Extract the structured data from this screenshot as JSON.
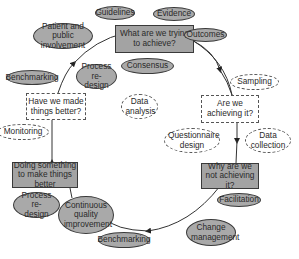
{
  "diagram": {
    "type": "cycle",
    "stages": [
      {
        "id": "s1",
        "label": "What are we trying to achieve?"
      },
      {
        "id": "s2",
        "label": "Are we achieving it?"
      },
      {
        "id": "s3",
        "label": "Why are we not achieving it?"
      },
      {
        "id": "s4",
        "label": "Doing something to make things better"
      },
      {
        "id": "s5",
        "label": "Have we made things better?"
      }
    ],
    "tools_solid": {
      "guidelines": "Guidelines",
      "evidence": "Evidence",
      "outcomes": "Outcomes",
      "patient": "Patient and public involvement",
      "consensus": "Consensus",
      "process_top": "Process re-design",
      "benchmarking_left": "Benchmarking",
      "facilitation": "Facilitation",
      "change": "Change management",
      "process_bottom": "Process re-design",
      "cqi": "Continuous quality improvement",
      "benchmarking_bottom": "Benchmarking"
    },
    "tools_dashed": {
      "sampling": "Sampling",
      "data_analysis": "Data analysis",
      "questionnaire": "Questionnaire design",
      "data_collection": "Data collection",
      "monitoring": "Monitoring"
    }
  }
}
